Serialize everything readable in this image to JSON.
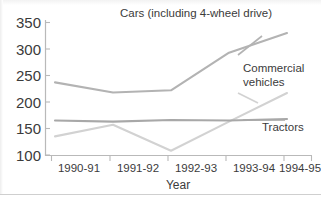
{
  "chart_data": {
    "type": "line",
    "title": "",
    "xlabel": "Year",
    "ylabel": "",
    "categories": [
      "1990-91",
      "1991-92",
      "1992-93",
      "1993-94",
      "1994-95"
    ],
    "yticks": [
      100,
      150,
      200,
      250,
      300,
      350
    ],
    "ylim": [
      100,
      350
    ],
    "grid": false,
    "legend_position": "inline-annotations",
    "series": [
      {
        "name": "Cars (including 4-wheel drive)",
        "values": [
          237,
          218,
          222,
          293,
          330
        ],
        "color": "#b3b3b3"
      },
      {
        "name": "Commercial vehicles",
        "values": [
          135,
          157,
          108,
          163,
          217
        ],
        "color": "#d2d2d2"
      },
      {
        "name": "Tractors",
        "values": [
          165,
          163,
          166,
          165,
          168
        ],
        "color": "#a8a8a8"
      }
    ],
    "annotations": [
      {
        "text": "Cars (including 4-wheel drive)",
        "series": "Cars (including 4-wheel drive)"
      },
      {
        "text_line1": "Commercial",
        "text_line2": "vehicles",
        "series": "Commercial vehicles"
      },
      {
        "text": "Tractors",
        "series": "Tractors"
      }
    ]
  },
  "axis": {
    "y_labels": [
      "350",
      "300",
      "250",
      "200",
      "150",
      "100"
    ],
    "x_labels": [
      "1990-91",
      "1991-92",
      "1992-93",
      "1993-94",
      "1994-95"
    ],
    "x_title": "Year"
  },
  "labels": {
    "cars": "Cars (including 4-wheel drive)",
    "commercial_line1": "Commercial",
    "commercial_line2": "vehicles",
    "tractors": "Tractors"
  },
  "colors": {
    "cars_line": "#b3b3b3",
    "commercial_line": "#d2d2d2",
    "tractors_line": "#a8a8a8",
    "axis": "#b9b9b9",
    "text": "#3b3b3b",
    "background": "#ffffff"
  }
}
